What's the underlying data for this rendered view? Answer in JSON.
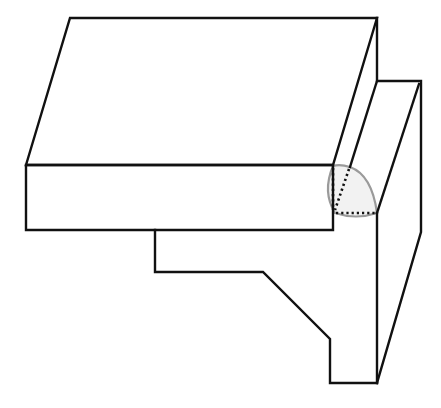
{
  "diagram": {
    "type": "isometric-line-drawing",
    "colors": {
      "background": "#ffffff",
      "line": "#111111",
      "fillet_outline": "#9a9a9a",
      "fillet_fill": "#f2f2f2"
    },
    "shapes": {
      "top_slab_top_face": "26,165 70,18 377,18 333,165",
      "top_slab_front_face": "26,165 333,165 333,230 26,230",
      "upper_right_vertical": "377,18 377,81",
      "right_step_top": "377,81 421,81",
      "right_outer_vertical": "421,81 421,232",
      "right_outer_lower_diagonal": "421,232 377,383",
      "inner_diag_1": "377,81 350,167",
      "inner_diag_2": "419,84 377,213",
      "inner_vertical": "377,213 377,383",
      "lower_profile": "155,230 155,272 263,272 330,339 330,383 377,383",
      "fillet_region": "M333,166 Q340,164 350,167 Q372,175 377,213 Q356,220 335,213 Q322,192 333,166 Z",
      "hidden_lines": [
        "333,168 333,210",
        "349,169 335,210",
        "336,213 376,213"
      ]
    }
  }
}
